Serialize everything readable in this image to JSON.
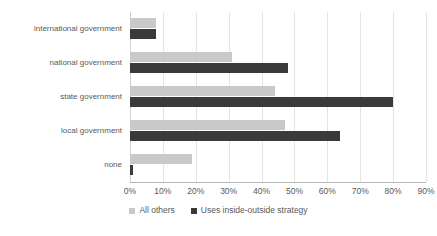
{
  "chart_data": {
    "type": "bar",
    "orientation": "horizontal",
    "title": "",
    "xlabel": "",
    "ylabel": "",
    "xlim": [
      0,
      90
    ],
    "xtick_labels": [
      "0%",
      "10%",
      "20%",
      "30%",
      "40%",
      "50%",
      "60%",
      "70%",
      "80%",
      "90%"
    ],
    "xtick_values": [
      0,
      10,
      20,
      30,
      40,
      50,
      60,
      70,
      80,
      90
    ],
    "grid": true,
    "legend_position": "bottom",
    "categories": [
      "international government",
      "national government",
      "state government",
      "local government",
      "none"
    ],
    "series": [
      {
        "name": "All others",
        "color": "#c9c9c9",
        "values": [
          8,
          31,
          44,
          47,
          19
        ]
      },
      {
        "name": "Uses inside-outside strategy",
        "color": "#3a3a3a",
        "values": [
          8,
          48,
          80,
          64,
          1
        ]
      }
    ]
  },
  "legend": {
    "items": [
      {
        "label": "All others",
        "color": "#c9c9c9"
      },
      {
        "label": "Uses inside-outside strategy",
        "color": "#3a3a3a"
      }
    ]
  }
}
